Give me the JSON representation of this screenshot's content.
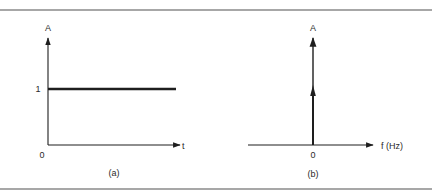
{
  "figure": {
    "panels": [
      {
        "id": "a",
        "caption": "(a)",
        "y_axis_label": "A",
        "x_axis_label": "t",
        "origin_label": "0",
        "level_tick_label": "1",
        "description": "Constant signal x(t) = 1 in time domain"
      },
      {
        "id": "b",
        "caption": "(b)",
        "y_axis_label": "A",
        "x_axis_label": "f (Hz)",
        "origin_label": "0",
        "description": "Impulse at f = 0 in frequency domain (spectrum of DC signal)"
      }
    ]
  },
  "colors": {
    "ink": "#1e1e1e",
    "rule": "#8a8a8a",
    "background": "#ffffff"
  }
}
